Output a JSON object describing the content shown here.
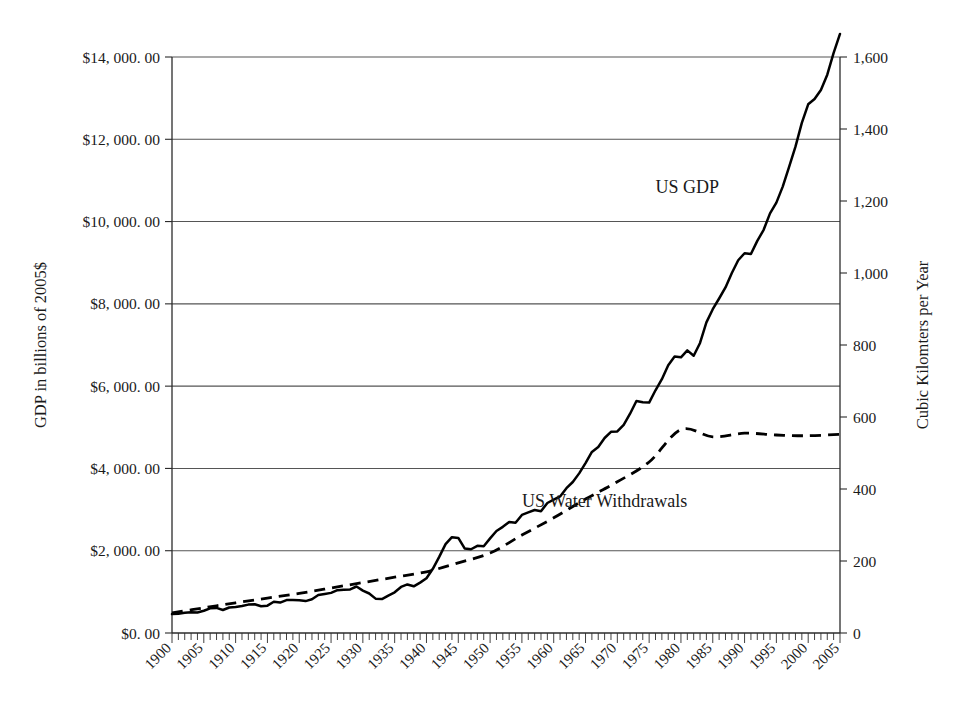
{
  "chart_data": {
    "type": "line",
    "title": "",
    "subtitle": "",
    "xlabel": "",
    "ylabel": "GDP in billions of 2005$",
    "y2label": "Cubic Kilomters per Year",
    "xlim": [
      1900,
      2005
    ],
    "ylim": [
      0,
      14000
    ],
    "y2lim": [
      0,
      1600
    ],
    "grid": true,
    "legend_position": "inline-annotations",
    "x_tick_labels": [
      "1900",
      "1905",
      "1910",
      "1915",
      "1920",
      "1925",
      "1930",
      "1935",
      "1940",
      "1945",
      "1950",
      "1955",
      "1960",
      "1965",
      "1970",
      "1975",
      "1980",
      "1985",
      "1990",
      "1995",
      "2000",
      "2005"
    ],
    "y_tick_labels": [
      "$0. 00",
      "$2, 000. 00",
      "$4, 000. 00",
      "$6, 000. 00",
      "$8, 000. 00",
      "$10, 000. 00",
      "$12, 000. 00",
      "$14, 000. 00"
    ],
    "y_tick_values": [
      0,
      2000,
      4000,
      6000,
      8000,
      10000,
      12000,
      14000
    ],
    "y2_tick_labels": [
      "0",
      "200",
      "400",
      "600",
      "800",
      "1,000",
      "1,200",
      "1,400",
      "1,600"
    ],
    "y2_tick_values": [
      0,
      200,
      400,
      600,
      800,
      1000,
      1200,
      1400,
      1600
    ],
    "series": [
      {
        "name": "US GDP",
        "axis": "left",
        "style": "solid",
        "color": "#000000",
        "annotation": {
          "text": "US GDP",
          "x": 1981,
          "y": 10700
        },
        "x": [
          1900,
          1901,
          1902,
          1903,
          1904,
          1905,
          1906,
          1907,
          1908,
          1909,
          1910,
          1911,
          1912,
          1913,
          1914,
          1915,
          1916,
          1917,
          1918,
          1919,
          1920,
          1921,
          1922,
          1923,
          1924,
          1925,
          1926,
          1927,
          1928,
          1929,
          1930,
          1931,
          1932,
          1933,
          1934,
          1935,
          1936,
          1937,
          1938,
          1939,
          1940,
          1941,
          1942,
          1943,
          1944,
          1945,
          1946,
          1947,
          1948,
          1949,
          1950,
          1951,
          1952,
          1953,
          1954,
          1955,
          1956,
          1957,
          1958,
          1959,
          1960,
          1961,
          1962,
          1963,
          1964,
          1965,
          1966,
          1967,
          1968,
          1969,
          1970,
          1971,
          1972,
          1973,
          1974,
          1975,
          1976,
          1977,
          1978,
          1979,
          1980,
          1981,
          1982,
          1983,
          1984,
          1985,
          1986,
          1987,
          1988,
          1989,
          1990,
          1991,
          1992,
          1993,
          1994,
          1995,
          1996,
          1997,
          1998,
          1999,
          2000,
          2001,
          2002,
          2003,
          2004,
          2005
        ],
        "values": [
          460,
          470,
          490,
          505,
          500,
          540,
          600,
          610,
          560,
          620,
          630,
          655,
          690,
          700,
          650,
          665,
          760,
          740,
          800,
          800,
          795,
          775,
          820,
          925,
          950,
          975,
          1040,
          1050,
          1060,
          1130,
          1030,
          960,
          835,
          825,
          910,
          990,
          1120,
          1180,
          1135,
          1225,
          1330,
          1560,
          1850,
          2160,
          2330,
          2310,
          2055,
          2035,
          2120,
          2110,
          2300,
          2480,
          2580,
          2700,
          2680,
          2870,
          2930,
          2990,
          2960,
          3160,
          3240,
          3320,
          3520,
          3670,
          3880,
          4130,
          4400,
          4520,
          4740,
          4890,
          4900,
          5060,
          5330,
          5640,
          5610,
          5600,
          5900,
          6170,
          6510,
          6720,
          6700,
          6870,
          6740,
          7050,
          7550,
          7870,
          8130,
          8400,
          8750,
          9060,
          9230,
          9210,
          9530,
          9800,
          10200,
          10460,
          10850,
          11330,
          11820,
          12400,
          12850,
          12980,
          13200,
          13570,
          14100,
          14560
        ]
      },
      {
        "name": "US Water Withdrawals",
        "axis": "right",
        "style": "dashed",
        "color": "#000000",
        "annotation": {
          "text": "US Water Withdrawals",
          "x": 1968,
          "y": 350
        },
        "x": [
          1900,
          1905,
          1910,
          1915,
          1920,
          1925,
          1930,
          1935,
          1940,
          1945,
          1950,
          1955,
          1960,
          1965,
          1970,
          1975,
          1980,
          1985,
          1990,
          1995,
          2000,
          2005
        ],
        "values": [
          56,
          70,
          84,
          97,
          110,
          125,
          140,
          155,
          170,
          195,
          222,
          272,
          320,
          372,
          420,
          475,
          565,
          545,
          555,
          550,
          548,
          552
        ]
      }
    ]
  },
  "annotations": {
    "gdp_label": "US GDP",
    "water_label": "US Water Withdrawals"
  },
  "axes": {
    "left_title": "GDP in billions of 2005$",
    "right_title": "Cubic Kilomters per Year"
  },
  "colors": {
    "line": "#000000",
    "grid": "#555555",
    "axis": "#2b2b2b",
    "background": "#ffffff"
  }
}
